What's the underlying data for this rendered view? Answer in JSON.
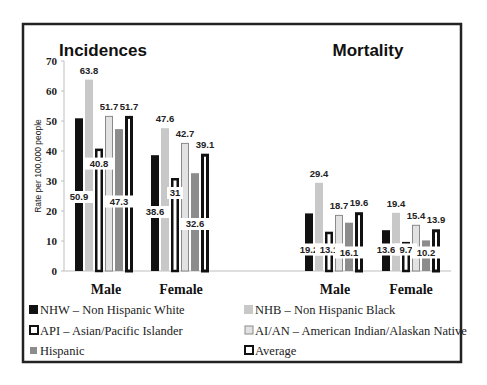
{
  "chart_data": [
    {
      "type": "bar",
      "title": "Incidences",
      "categories": [
        "Male",
        "Female"
      ],
      "ylabel": "Rate per 100,000 people",
      "xlabel": "",
      "ylim": [
        0,
        70
      ],
      "yticks": [
        0,
        10,
        20,
        30,
        40,
        50,
        60,
        70
      ],
      "grid": false,
      "legend_position": "bottom",
      "series": [
        {
          "name": "NHW – Non Hispanic White",
          "values": [
            50.9,
            38.6
          ]
        },
        {
          "name": "NHB – Non Hispanic Black",
          "values": [
            63.8,
            47.6
          ]
        },
        {
          "name": "API – Asian/Pacific Islander",
          "values": [
            40.8,
            31
          ]
        },
        {
          "name": "AI/AN – American Indian/Alaskan Native",
          "values": [
            51.7,
            42.7
          ]
        },
        {
          "name": "Hispanic",
          "values": [
            47.3,
            32.6
          ]
        },
        {
          "name": "Average",
          "values": [
            51.7,
            39.1
          ]
        }
      ]
    },
    {
      "type": "bar",
      "title": "Mortality",
      "categories": [
        "Male",
        "Female"
      ],
      "ylabel": "Rate per 100,000 people",
      "xlabel": "",
      "ylim": [
        0,
        70
      ],
      "grid": false,
      "legend_position": "bottom",
      "series": [
        {
          "name": "NHW – Non Hispanic White",
          "values": [
            19.2,
            13.6
          ]
        },
        {
          "name": "NHB – Non Hispanic Black",
          "values": [
            29.4,
            19.4
          ]
        },
        {
          "name": "API – Asian/Pacific Islander",
          "values": [
            13.1,
            9.7
          ]
        },
        {
          "name": "AI/AN – American Indian/Alaskan Native",
          "values": [
            18.7,
            15.4
          ]
        },
        {
          "name": "Hispanic",
          "values": [
            16.1,
            10.2
          ]
        },
        {
          "name": "Average",
          "values": [
            19.6,
            13.9
          ]
        }
      ]
    }
  ],
  "series_styles": [
    {
      "fill": "#111111",
      "stroke": "#111111",
      "stroke_width": 0
    },
    {
      "fill": "#c8c8c8",
      "stroke": "#c8c8c8",
      "stroke_width": 0
    },
    {
      "fill": "#ffffff",
      "stroke": "#111111",
      "stroke_width": 2.5
    },
    {
      "fill": "#e2e2e2",
      "stroke": "#8a8a8a",
      "stroke_width": 1
    },
    {
      "fill": "#8c8c8c",
      "stroke": "#8c8c8c",
      "stroke_width": 0
    },
    {
      "fill": "#ffffff",
      "stroke": "#111111",
      "stroke_width": 3
    }
  ],
  "label_positions": [
    [
      "inside",
      "above",
      "inside",
      "above",
      "inside",
      "above"
    ],
    [
      "inside",
      "above",
      "inside",
      "above",
      "inside",
      "above"
    ]
  ],
  "legend": {
    "items": [
      {
        "label": "NHW – Non Hispanic White",
        "style": 0
      },
      {
        "label": "NHB – Non Hispanic Black",
        "style": 1
      },
      {
        "label": "API – Asian/Pacific Islander",
        "style": 2
      },
      {
        "label": "AI/AN – American Indian/Alaskan Native",
        "style": 3
      },
      {
        "label": "Hispanic",
        "style": 4
      },
      {
        "label": "Average",
        "style": 5
      }
    ]
  }
}
